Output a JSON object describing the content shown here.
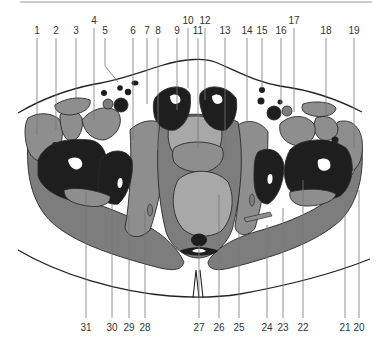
{
  "diagram": {
    "colors": {
      "background": "#ffffff",
      "top_rule": "#9a9a9a",
      "muscle_dark_gray": "#7d7d7d",
      "muscle_mid_gray": "#8e8e8e",
      "organ_light_gray": "#a8a8a8",
      "bone_black": "#1e1e1e",
      "marrow_white": "#ffffff",
      "skin_outline": "#222222",
      "leader_line": "#777777",
      "label_text": "#333333"
    },
    "top_labels": [
      {
        "n": "1",
        "x": 37,
        "y": 34
      },
      {
        "n": "2",
        "x": 56,
        "y": 34
      },
      {
        "n": "3",
        "x": 76,
        "y": 34
      },
      {
        "n": "4",
        "x": 94,
        "y": 24
      },
      {
        "n": "5",
        "x": 105,
        "y": 34
      },
      {
        "n": "6",
        "x": 133,
        "y": 34
      },
      {
        "n": "7",
        "x": 147,
        "y": 34
      },
      {
        "n": "8",
        "x": 158,
        "y": 34
      },
      {
        "n": "9",
        "x": 177,
        "y": 34
      },
      {
        "n": "10",
        "x": 188,
        "y": 24
      },
      {
        "n": "11",
        "x": 198,
        "y": 34
      },
      {
        "n": "12",
        "x": 205,
        "y": 24
      },
      {
        "n": "13",
        "x": 225,
        "y": 34
      },
      {
        "n": "14",
        "x": 247,
        "y": 34
      },
      {
        "n": "15",
        "x": 262,
        "y": 34
      },
      {
        "n": "16",
        "x": 281,
        "y": 34
      },
      {
        "n": "17",
        "x": 294,
        "y": 24
      },
      {
        "n": "18",
        "x": 326,
        "y": 34
      },
      {
        "n": "19",
        "x": 354,
        "y": 34
      }
    ],
    "bottom_labels": [
      {
        "n": "31",
        "x": 86
      },
      {
        "n": "30",
        "x": 112
      },
      {
        "n": "29",
        "x": 129
      },
      {
        "n": "28",
        "x": 145
      },
      {
        "n": "27",
        "x": 199
      },
      {
        "n": "26",
        "x": 219
      },
      {
        "n": "25",
        "x": 239
      },
      {
        "n": "24",
        "x": 267
      },
      {
        "n": "23",
        "x": 283
      },
      {
        "n": "22",
        "x": 303
      },
      {
        "n": "21",
        "x": 345
      },
      {
        "n": "20",
        "x": 359
      }
    ]
  }
}
